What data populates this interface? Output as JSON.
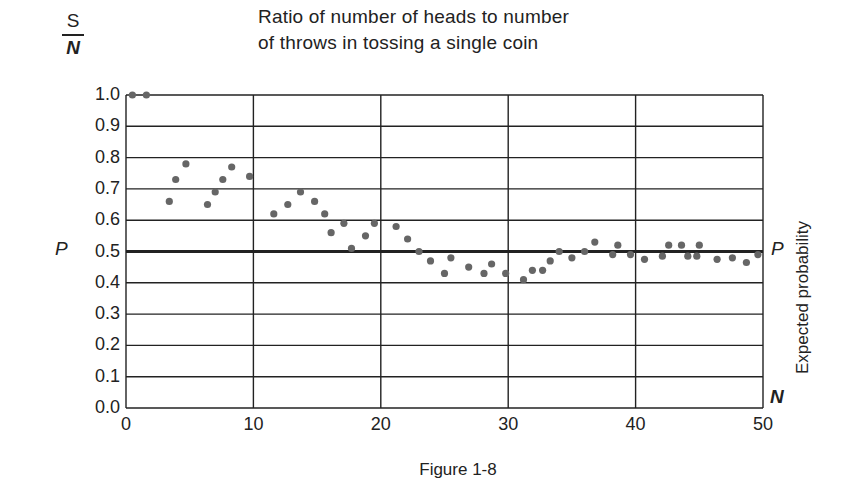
{
  "chart_data": {
    "type": "scatter",
    "title": "Ratio of number of heads to number of throws in tossing a single coin",
    "title_lines": [
      "Ratio of number of heads to number",
      "of throws in tossing a single coin"
    ],
    "xlabel": "N",
    "ylabel": "S/N",
    "ylabel_numerator": "S",
    "ylabel_denominator": "N",
    "right_ylabel": "Expected probability",
    "reference_line": {
      "label": "P",
      "y": 0.5
    },
    "xlim": [
      0,
      50
    ],
    "ylim": [
      0.0,
      1.0
    ],
    "x_ticks": [
      "0",
      "10",
      "20",
      "30",
      "40",
      "50"
    ],
    "y_ticks": [
      "1.0",
      "0.9",
      "0.8",
      "0.7",
      "0.6",
      "0.5",
      "0.4",
      "0.3",
      "0.2",
      "0.1",
      "0.0"
    ],
    "grid": true,
    "caption": "Figure 1-8",
    "points": [
      [
        0.5,
        1.0
      ],
      [
        1.6,
        1.0
      ],
      [
        3.4,
        0.66
      ],
      [
        3.9,
        0.73
      ],
      [
        4.7,
        0.78
      ],
      [
        6.4,
        0.65
      ],
      [
        7.0,
        0.69
      ],
      [
        7.6,
        0.73
      ],
      [
        8.3,
        0.77
      ],
      [
        9.7,
        0.74
      ],
      [
        11.6,
        0.62
      ],
      [
        12.7,
        0.65
      ],
      [
        13.7,
        0.69
      ],
      [
        14.8,
        0.66
      ],
      [
        15.6,
        0.62
      ],
      [
        16.1,
        0.56
      ],
      [
        17.1,
        0.59
      ],
      [
        17.7,
        0.51
      ],
      [
        18.8,
        0.55
      ],
      [
        19.5,
        0.59
      ],
      [
        21.2,
        0.58
      ],
      [
        22.1,
        0.54
      ],
      [
        23.0,
        0.5
      ],
      [
        23.9,
        0.47
      ],
      [
        25.0,
        0.43
      ],
      [
        25.5,
        0.48
      ],
      [
        26.9,
        0.45
      ],
      [
        28.1,
        0.43
      ],
      [
        28.7,
        0.46
      ],
      [
        29.8,
        0.43
      ],
      [
        31.2,
        0.41
      ],
      [
        31.9,
        0.44
      ],
      [
        32.7,
        0.44
      ],
      [
        33.3,
        0.47
      ],
      [
        34.0,
        0.5
      ],
      [
        35.0,
        0.48
      ],
      [
        36.0,
        0.5
      ],
      [
        36.8,
        0.53
      ],
      [
        38.2,
        0.49
      ],
      [
        38.6,
        0.52
      ],
      [
        39.6,
        0.49
      ],
      [
        40.7,
        0.475
      ],
      [
        42.1,
        0.485
      ],
      [
        42.6,
        0.52
      ],
      [
        43.6,
        0.52
      ],
      [
        44.1,
        0.485
      ],
      [
        44.8,
        0.485
      ],
      [
        45.0,
        0.52
      ],
      [
        46.4,
        0.475
      ],
      [
        47.6,
        0.48
      ],
      [
        48.7,
        0.465
      ],
      [
        49.6,
        0.49
      ]
    ]
  },
  "labels": {
    "title_line_1": "Ratio of number of heads to number",
    "title_line_2": "of throws in tossing a single coin",
    "y_numerator": "S",
    "y_denominator": "N",
    "p_left": "P",
    "p_right": "P",
    "n_axis": "N",
    "right_axis": "Expected probability",
    "caption": "Figure 1-8"
  },
  "colors": {
    "ink": "#222222",
    "dot": "#666666",
    "background": "#ffffff"
  }
}
